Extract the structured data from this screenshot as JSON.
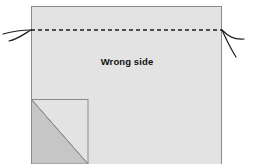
{
  "figure": {
    "type": "sewing-diagram",
    "background_color": "#ffffff"
  },
  "labels": {
    "wrong_side": "Wrong side"
  },
  "colors": {
    "fabric_fill": "#e3e3e3",
    "fabric_stroke": "#8a8a8a",
    "folded_triangle_fill": "#c6c6c6",
    "folded_triangle_stroke": "#8a8a8a",
    "dashed_line": "#1d1d1d",
    "thread": "#1d1d1d",
    "label_text": "#111111"
  },
  "shapes": {
    "main_fabric": {
      "name": "main-fabric-rectangle",
      "x": 31,
      "y": 6,
      "width": 191,
      "height": 158
    },
    "corner_square": {
      "name": "folded-corner-square",
      "x": 31,
      "y": 99,
      "width": 57,
      "height": 65
    },
    "folded_triangle": {
      "name": "folded-corner-triangle",
      "points": "31,99 88,164 31,164"
    },
    "dashed_fold_line": {
      "name": "dashed-fold-line",
      "x1": 31,
      "y1": 30,
      "x2": 222,
      "y2": 30,
      "dash_pattern": "4,3",
      "stroke_width": 1.4
    }
  },
  "threads": {
    "left": [
      {
        "name": "thread-left-upper",
        "path": "M 31 30 C 22 30, 14 31, 3 34"
      },
      {
        "name": "thread-left-lower",
        "path": "M 31 30 C 24 34, 18 39, 9 41"
      }
    ],
    "right": [
      {
        "name": "thread-right-upper",
        "path": "M 222 30 C 228 36, 234 40, 244 39"
      },
      {
        "name": "thread-right-lower",
        "path": "M 222 30 C 226 39, 231 49, 236 57"
      }
    ]
  },
  "label_position": {
    "x": 127,
    "y": 65
  }
}
